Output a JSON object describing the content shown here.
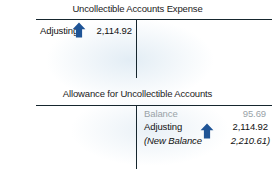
{
  "colors": {
    "arrow_blue": "#1f5496",
    "rule_dark": "#16262e",
    "text_dark": "#111111",
    "text_muted": "#9aa3a8",
    "page_background": "#ffffff"
  },
  "accounts": [
    {
      "id": "uncollectible-accounts-expense",
      "title": "Uncollectible Accounts Expense",
      "side": "debit",
      "entries": [
        {
          "label": "Adjusting",
          "amount": "2,114.92",
          "arrow": "up-arrow-icon",
          "style": "normal"
        }
      ]
    },
    {
      "id": "allowance-for-uncollectible-accounts",
      "title": "Allowance for Uncollectible Accounts",
      "side": "credit",
      "entries": [
        {
          "label": "Balance",
          "amount": "95.69",
          "arrow": null,
          "style": "muted"
        },
        {
          "label": "Adjusting",
          "amount": "2,114.92",
          "arrow": "up-arrow-icon",
          "style": "normal"
        },
        {
          "label": "(New Balance",
          "amount": "2,210.61)",
          "arrow": null,
          "style": "italic"
        }
      ]
    }
  ]
}
